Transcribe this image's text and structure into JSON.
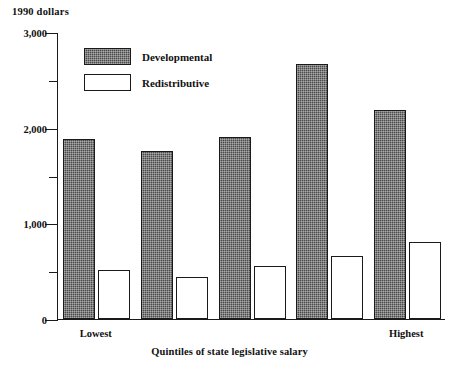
{
  "chart_data": {
    "type": "bar",
    "title": "",
    "unit_label": "1990 dollars",
    "xlabel": "Quintiles of state legislative salary",
    "ylabel": "",
    "categories": [
      "Lowest",
      "",
      "",
      "",
      "Highest"
    ],
    "visible_tick_labels": [
      "Lowest",
      "Highest"
    ],
    "series": [
      {
        "name": "Developmental",
        "color": "#4a4a4a",
        "fill": "hatched-dark",
        "values": [
          1880,
          1755,
          1900,
          2665,
          2190
        ]
      },
      {
        "name": "Redistributive",
        "color": "#ffffff",
        "fill": "white-outline",
        "values": [
          510,
          440,
          555,
          660,
          805
        ]
      }
    ],
    "ylim": [
      0,
      3000
    ],
    "ytick_major": [
      0,
      1000,
      2000,
      3000
    ],
    "ytick_major_labels": [
      "0",
      "1,000",
      "2,000",
      "3,000"
    ],
    "ytick_minor": [
      500,
      1500,
      2500
    ],
    "grid": false,
    "legend_position": "top-left-inside"
  },
  "legend": {
    "items": [
      {
        "label": "Developmental"
      },
      {
        "label": "Redistributive"
      }
    ]
  }
}
